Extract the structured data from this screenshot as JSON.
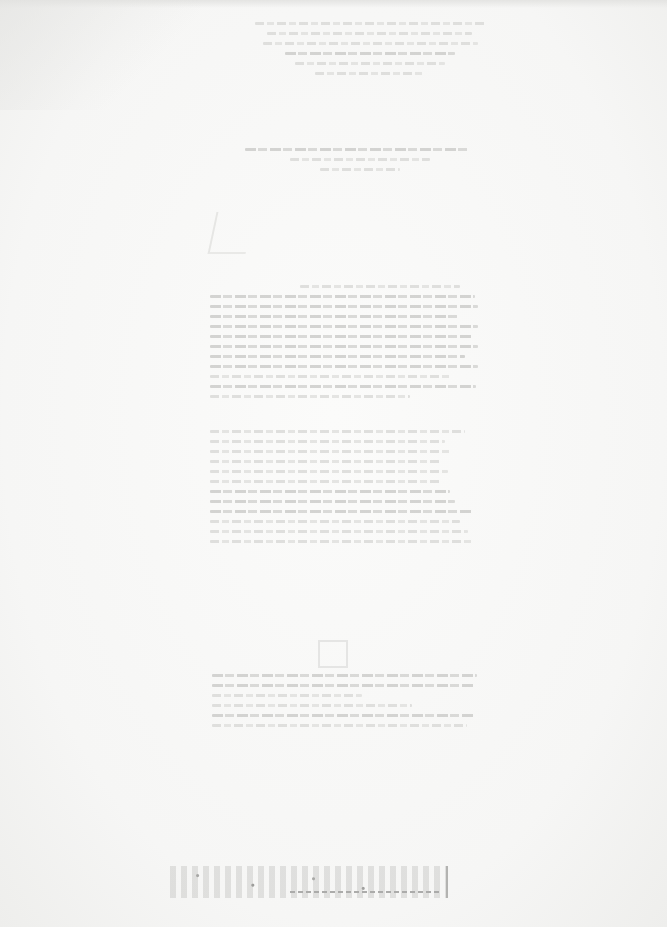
{
  "document": {
    "type": "scanned-page",
    "legibility": "illegible",
    "note_visible_text": "",
    "header": {
      "lines": 6
    },
    "title_block": {
      "lines": 3
    },
    "body_block_1": {
      "lines": 12
    },
    "body_block_2": {
      "lines": 12
    },
    "bottom_block": {
      "lines": 6
    },
    "footer_stamp": {
      "text": ""
    }
  },
  "colors": {
    "paper": "#f7f7f6",
    "faint_ink": "#dcdcda",
    "stamp_ink": "#9a9a98"
  }
}
